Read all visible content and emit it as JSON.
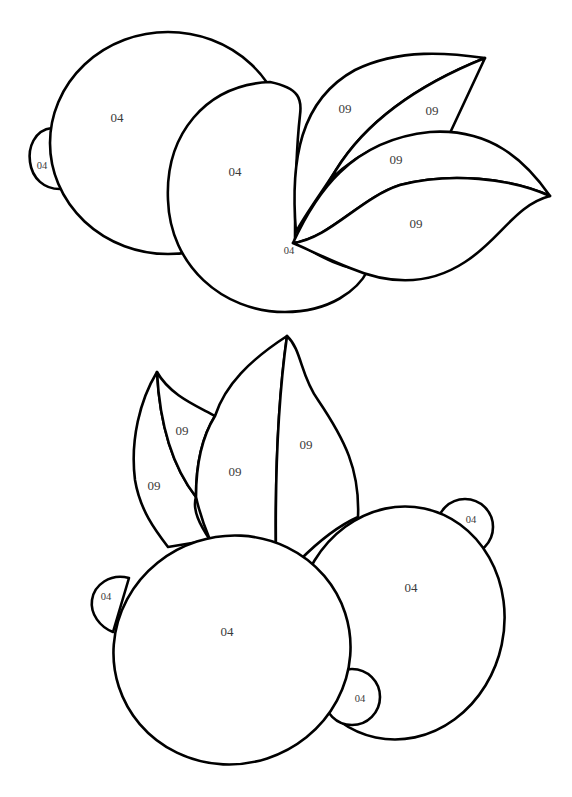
{
  "page": {
    "type": "color-by-number coloring page",
    "background": "#ffffff",
    "line_color": "#000000"
  },
  "groups": {
    "top": {
      "lemon_back": {
        "label": "04"
      },
      "lemon_back_tip": {
        "label": "04"
      },
      "lemon_front": {
        "label": "04"
      },
      "lemon_front_tip": {
        "label": "04"
      },
      "leaf_upper_left": {
        "label": "09"
      },
      "leaf_upper_right": {
        "label": "09"
      },
      "leaf_lower_top": {
        "label": "09"
      },
      "leaf_lower_bottom": {
        "label": "09"
      }
    },
    "bottom": {
      "leaf_small_left": {
        "label": "09"
      },
      "leaf_small_right": {
        "label": "09"
      },
      "leaf_big_left": {
        "label": "09"
      },
      "leaf_big_right": {
        "label": "09"
      },
      "lemon_front": {
        "label": "04"
      },
      "lemon_front_tip": {
        "label": "04"
      },
      "lemon_back": {
        "label": "04"
      },
      "lemon_back_tip_top": {
        "label": "04"
      },
      "lemon_back_tip_bottom": {
        "label": "04"
      }
    }
  },
  "color_key": [
    {
      "number": "04",
      "meaning": "lemon body"
    },
    {
      "number": "09",
      "meaning": "leaf"
    }
  ]
}
